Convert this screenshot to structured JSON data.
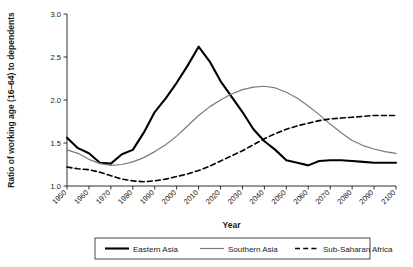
{
  "chart_data": {
    "type": "line",
    "title": "",
    "xlabel": "Year",
    "ylabel": "Ratio of working age (16–64) to dependents",
    "xlim": [
      1950,
      2100
    ],
    "ylim": [
      1.0,
      3.0
    ],
    "xticks": [
      "1950",
      "1960",
      "1970",
      "1980",
      "1990",
      "2000",
      "2010",
      "2020",
      "2030",
      "2040",
      "2050",
      "2060",
      "2070",
      "2080",
      "2090",
      "2100"
    ],
    "yticks": [
      "1.0",
      "1.5",
      "2.0",
      "2.5",
      "3.0"
    ],
    "grid": false,
    "legend_position": "bottom",
    "x": [
      1950,
      1955,
      1960,
      1965,
      1970,
      1975,
      1980,
      1985,
      1990,
      1995,
      2000,
      2005,
      2010,
      2015,
      2020,
      2025,
      2030,
      2035,
      2040,
      2045,
      2050,
      2055,
      2060,
      2065,
      2070,
      2075,
      2080,
      2085,
      2090,
      2095,
      2100
    ],
    "series": [
      {
        "name": "Eastern Asia",
        "style": "solid-thick",
        "color": "#000000",
        "values": [
          1.56,
          1.44,
          1.38,
          1.27,
          1.26,
          1.37,
          1.42,
          1.62,
          1.86,
          2.02,
          2.2,
          2.4,
          2.62,
          2.45,
          2.22,
          2.04,
          1.86,
          1.66,
          1.52,
          1.42,
          1.3,
          1.27,
          1.24,
          1.29,
          1.3,
          1.3,
          1.29,
          1.28,
          1.27,
          1.27,
          1.27
        ]
      },
      {
        "name": "Southern Asia",
        "style": "solid-thin",
        "color": "#7a7a7a",
        "values": [
          1.42,
          1.38,
          1.31,
          1.26,
          1.24,
          1.25,
          1.28,
          1.33,
          1.4,
          1.48,
          1.58,
          1.7,
          1.82,
          1.92,
          2.0,
          2.07,
          2.12,
          2.15,
          2.16,
          2.14,
          2.09,
          2.02,
          1.93,
          1.83,
          1.72,
          1.62,
          1.53,
          1.47,
          1.43,
          1.4,
          1.38
        ]
      },
      {
        "name": "Sub-Saharan Africa",
        "style": "dashed",
        "color": "#000000",
        "values": [
          1.22,
          1.2,
          1.19,
          1.16,
          1.12,
          1.08,
          1.06,
          1.05,
          1.06,
          1.08,
          1.11,
          1.14,
          1.18,
          1.23,
          1.29,
          1.35,
          1.41,
          1.48,
          1.55,
          1.61,
          1.66,
          1.7,
          1.73,
          1.76,
          1.78,
          1.79,
          1.8,
          1.81,
          1.82,
          1.82,
          1.82
        ]
      }
    ]
  }
}
